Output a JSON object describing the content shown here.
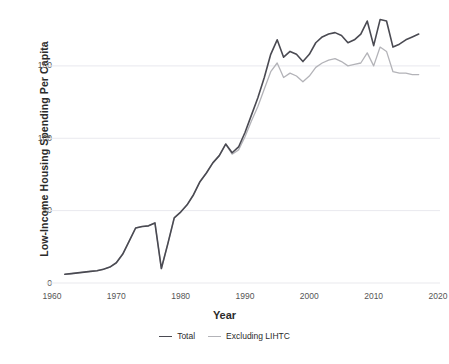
{
  "chart_data": {
    "type": "line",
    "title": "",
    "xlabel": "Year",
    "ylabel": "Low-Income Housing Spending Per Capita",
    "xlim": [
      1960,
      2020
    ],
    "ylim": [
      0,
      190
    ],
    "xticks": [
      1960,
      1970,
      1980,
      1990,
      2000,
      2010,
      2020
    ],
    "yticks": [
      0,
      50,
      100,
      150
    ],
    "grid": "horizontal",
    "legend_position": "bottom-center",
    "colors": {
      "total": "#4a4a52",
      "excluding_lihtc": "#b3b3b8",
      "gridline": "#e9e9ee",
      "background": "#ffffff",
      "text": "#2b2b2b",
      "tick_text": "#555555"
    },
    "x": [
      1962,
      1963,
      1964,
      1965,
      1966,
      1967,
      1968,
      1969,
      1970,
      1971,
      1972,
      1973,
      1974,
      1975,
      1976,
      1977,
      1978,
      1979,
      1980,
      1981,
      1982,
      1983,
      1984,
      1985,
      1986,
      1987,
      1988,
      1989,
      1990,
      1991,
      1992,
      1993,
      1994,
      1995,
      1996,
      1997,
      1998,
      1999,
      2000,
      2001,
      2002,
      2003,
      2004,
      2005,
      2006,
      2007,
      2008,
      2009,
      2010,
      2011,
      2012,
      2013,
      2014,
      2015,
      2016,
      2017
    ],
    "series": [
      {
        "name": "Total",
        "color": "#4a4a52",
        "values": [
          6,
          6.5,
          7,
          7.5,
          8,
          8.5,
          9.5,
          11,
          14,
          20,
          29,
          38,
          39,
          39.5,
          41.5,
          10,
          27,
          45,
          49,
          54,
          61,
          70,
          76,
          83,
          88,
          96,
          90,
          94,
          104,
          116,
          128,
          142,
          158,
          168,
          156,
          160,
          158,
          153,
          158,
          166,
          170,
          172,
          173,
          171,
          166,
          168,
          172,
          181,
          164,
          182,
          181,
          163,
          165,
          168,
          170,
          172
        ]
      },
      {
        "name": "Excluding LIHTC",
        "color": "#b3b3b8",
        "values": [
          6,
          6.5,
          7,
          7.5,
          8,
          8.5,
          9.5,
          11,
          14,
          20,
          29,
          38,
          39,
          39.5,
          41.5,
          10,
          27,
          45,
          49,
          54,
          61,
          70,
          76,
          83,
          88,
          96,
          89,
          92,
          101,
          112,
          122,
          134,
          146,
          152,
          142,
          145,
          143,
          139,
          143,
          149,
          152,
          154,
          155,
          153,
          150,
          151,
          152,
          159,
          150,
          163,
          160,
          146,
          145,
          145,
          144,
          144
        ]
      }
    ]
  },
  "legend": {
    "items": [
      {
        "label": "Total"
      },
      {
        "label": "Excluding LIHTC"
      }
    ]
  },
  "axis": {
    "x_tick_labels": [
      "1960",
      "1970",
      "1980",
      "1990",
      "2000",
      "2010",
      "2020"
    ],
    "y_tick_labels": [
      "0",
      "50",
      "100",
      "150"
    ],
    "x_title": "Year",
    "y_title": "Low-Income Housing Spending Per Capita"
  }
}
